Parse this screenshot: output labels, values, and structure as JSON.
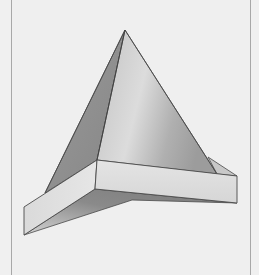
{
  "figure": {
    "colors": {
      "background": "#efefef",
      "frame_border": "#a8a8a8",
      "edge_stroke": "#4a4a4a",
      "face_light": "#d8d8d8",
      "face_mid": "#b4b4b4",
      "face_dark": "#8a8a8a",
      "band_face": "#e0e0e0",
      "band_top": "#cfcfcf"
    }
  }
}
